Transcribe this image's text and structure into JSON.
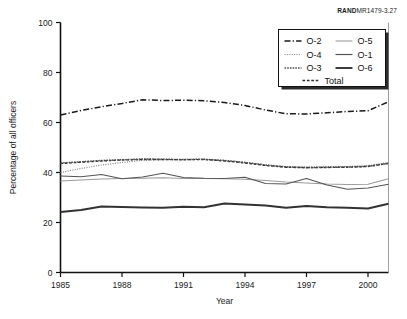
{
  "credit": {
    "brand": "RAND",
    "figure_id": "MR1479-3.27"
  },
  "chart_data": {
    "type": "line",
    "title": "",
    "xlabel": "Year",
    "ylabel": "Percentage of all officers",
    "xlim": [
      1985,
      2001
    ],
    "ylim": [
      0,
      100
    ],
    "xticks": [
      1985,
      1988,
      1991,
      1994,
      1997,
      2000
    ],
    "yticks": [
      0,
      20,
      40,
      60,
      80,
      100
    ],
    "grid": false,
    "legend_position": "top-right",
    "x": [
      1985,
      1986,
      1987,
      1988,
      1989,
      1990,
      1991,
      1992,
      1993,
      1994,
      1995,
      1996,
      1997,
      1998,
      1999,
      2000,
      2001
    ],
    "series": [
      {
        "name": "O-2",
        "style": "dash-dot",
        "color": "#1a1a1a",
        "width": 1.5,
        "values": [
          63.0,
          64.8,
          66.3,
          67.6,
          69.1,
          68.8,
          68.9,
          68.7,
          68.0,
          66.8,
          65.0,
          63.5,
          63.4,
          63.9,
          64.4,
          64.7,
          68.3
        ]
      },
      {
        "name": "O-4",
        "style": "fine-dotted",
        "color": "#8c8c8c",
        "width": 1.2,
        "values": [
          40.0,
          41.6,
          43.0,
          44.0,
          44.9,
          45.1,
          45.2,
          45.3,
          44.8,
          44.1,
          43.1,
          42.4,
          42.2,
          42.3,
          42.4,
          42.7,
          44.0
        ]
      },
      {
        "name": "O-3",
        "style": "dense-dotted",
        "color": "#4d4d4d",
        "width": 1.5,
        "values": [
          43.8,
          44.3,
          44.8,
          45.1,
          45.4,
          45.3,
          45.2,
          45.3,
          44.8,
          44.0,
          43.0,
          42.2,
          42.0,
          42.1,
          42.2,
          42.5,
          43.7
        ]
      },
      {
        "name": "Total",
        "style": "dashed",
        "color": "#2b2b2b",
        "width": 1.3,
        "values": [
          43.6,
          44.1,
          44.6,
          45.0,
          45.2,
          45.2,
          45.1,
          45.2,
          44.6,
          43.8,
          42.8,
          42.1,
          41.9,
          42.0,
          42.1,
          42.4,
          43.6
        ]
      },
      {
        "name": "O-5",
        "style": "solid",
        "color": "#9a9a9a",
        "width": 1.1,
        "values": [
          36.6,
          37.0,
          37.4,
          37.6,
          37.7,
          37.9,
          37.6,
          37.6,
          37.5,
          37.3,
          36.8,
          36.2,
          35.8,
          35.4,
          35.2,
          35.3,
          37.5
        ]
      },
      {
        "name": "O-1",
        "style": "solid",
        "color": "#555555",
        "width": 1.2,
        "values": [
          38.6,
          38.3,
          39.2,
          37.5,
          38.2,
          39.7,
          38.0,
          37.7,
          37.6,
          38.1,
          35.6,
          35.4,
          37.6,
          35.0,
          33.3,
          33.8,
          35.3
        ]
      },
      {
        "name": "O-6",
        "style": "solid",
        "color": "#333333",
        "width": 1.9,
        "values": [
          24.2,
          25.0,
          26.4,
          26.2,
          26.0,
          25.9,
          26.3,
          26.1,
          27.6,
          27.2,
          26.8,
          25.9,
          26.6,
          26.1,
          25.9,
          25.6,
          27.5
        ]
      }
    ]
  },
  "legend": {
    "entries": [
      {
        "label": "O-2",
        "column": 0,
        "row": 0
      },
      {
        "label": "O-5",
        "column": 1,
        "row": 0
      },
      {
        "label": "O-4",
        "column": 0,
        "row": 1
      },
      {
        "label": "O-1",
        "column": 1,
        "row": 1
      },
      {
        "label": "O-3",
        "column": 0,
        "row": 2
      },
      {
        "label": "O-6",
        "column": 1,
        "row": 2
      },
      {
        "label": "Total",
        "column": 0,
        "row": 3
      }
    ]
  }
}
